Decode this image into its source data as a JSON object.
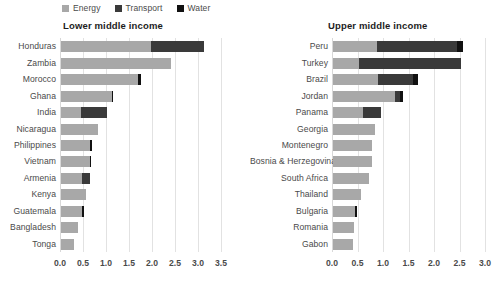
{
  "legend": {
    "items": [
      {
        "label": "Energy",
        "color": "#a8a8a8",
        "icon": "square-swatch-icon"
      },
      {
        "label": "Transport",
        "color": "#3a3a3a",
        "icon": "square-swatch-icon"
      },
      {
        "label": "Water",
        "color": "#111111",
        "icon": "square-swatch-icon"
      }
    ]
  },
  "chart_data": [
    {
      "type": "bar",
      "orientation": "horizontal",
      "stacked": true,
      "title": "Lower middle income",
      "xlabel": "",
      "ylabel": "",
      "xlim": [
        0.0,
        3.5
      ],
      "xticks": [
        "0.0",
        "0.5",
        "1.0",
        "1.5",
        "2.0",
        "2.5",
        "3.0",
        "3.5"
      ],
      "xtick_values": [
        0.0,
        0.5,
        1.0,
        1.5,
        2.0,
        2.5,
        3.0,
        3.5
      ],
      "grid": true,
      "legend_position": "top",
      "categories": [
        "Honduras",
        "Zambia",
        "Morocco",
        "Ghana",
        "India",
        "Nicaragua",
        "Philippines",
        "Vietnam",
        "Armenia",
        "Kenya",
        "Guatemala",
        "Bangladesh",
        "Tonga"
      ],
      "series": [
        {
          "name": "Energy",
          "color": "#a8a8a8",
          "values": [
            1.95,
            2.4,
            1.68,
            1.1,
            0.43,
            0.8,
            0.63,
            0.62,
            0.45,
            0.55,
            0.46,
            0.38,
            0.28
          ]
        },
        {
          "name": "Transport",
          "color": "#3a3a3a",
          "values": [
            1.15,
            0.0,
            0.0,
            0.0,
            0.57,
            0.0,
            0.0,
            0.0,
            0.18,
            0.0,
            0.0,
            0.0,
            0.0
          ]
        },
        {
          "name": "Water",
          "color": "#111111",
          "values": [
            0.0,
            0.0,
            0.05,
            0.03,
            0.0,
            0.0,
            0.05,
            0.03,
            0.0,
            0.0,
            0.03,
            0.0,
            0.0
          ]
        }
      ],
      "totals": [
        3.1,
        2.4,
        1.73,
        1.13,
        1.0,
        0.8,
        0.68,
        0.65,
        0.63,
        0.55,
        0.49,
        0.38,
        0.28
      ]
    },
    {
      "type": "bar",
      "orientation": "horizontal",
      "stacked": true,
      "title": "Upper middle income",
      "xlabel": "",
      "ylabel": "",
      "xlim": [
        0.0,
        3.0
      ],
      "xticks": [
        "0.0",
        "0.5",
        "1.0",
        "1.5",
        "2.0",
        "2.5",
        "3.0"
      ],
      "xtick_values": [
        0.0,
        0.5,
        1.0,
        1.5,
        2.0,
        2.5,
        3.0
      ],
      "grid": true,
      "legend_position": "top",
      "categories": [
        "Peru",
        "Turkey",
        "Brazil",
        "Jordan",
        "Panama",
        "Georgia",
        "Montenegro",
        "Bosnia & Herzegovina",
        "South Africa",
        "Thailand",
        "Bulgaria",
        "Romania",
        "Gabon"
      ],
      "series": [
        {
          "name": "Energy",
          "color": "#a8a8a8",
          "values": [
            0.86,
            0.5,
            0.88,
            1.22,
            0.58,
            0.82,
            0.76,
            0.76,
            0.7,
            0.55,
            0.44,
            0.41,
            0.4
          ]
        },
        {
          "name": "Transport",
          "color": "#3a3a3a",
          "values": [
            1.57,
            2.01,
            0.69,
            0.1,
            0.37,
            0.0,
            0.0,
            0.0,
            0.0,
            0.0,
            0.0,
            0.0,
            0.0
          ]
        },
        {
          "name": "Water",
          "color": "#111111",
          "values": [
            0.12,
            0.0,
            0.1,
            0.06,
            0.0,
            0.0,
            0.0,
            0.0,
            0.0,
            0.0,
            0.03,
            0.0,
            0.0
          ]
        }
      ],
      "totals": [
        2.55,
        2.51,
        1.67,
        1.38,
        0.95,
        0.82,
        0.76,
        0.76,
        0.7,
        0.55,
        0.47,
        0.41,
        0.4
      ]
    }
  ]
}
